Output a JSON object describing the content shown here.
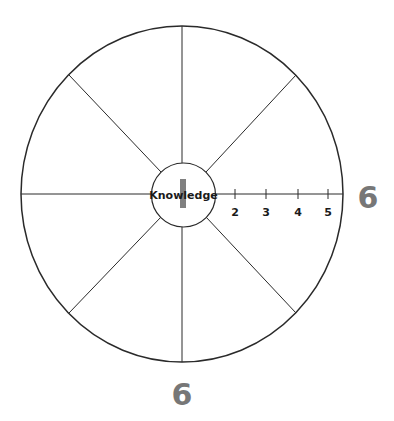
{
  "diagram": {
    "type": "radial-wheel",
    "segments": 8,
    "center_label": "Knowledge",
    "center_marker": "I",
    "scale_ticks": [
      "2",
      "3",
      "4",
      "5"
    ],
    "outer_labels": {
      "right": "6",
      "bottom": "6"
    },
    "colors": {
      "lines": "#2a2a2a",
      "outer_label": "#777777",
      "marker": "#808080"
    }
  }
}
